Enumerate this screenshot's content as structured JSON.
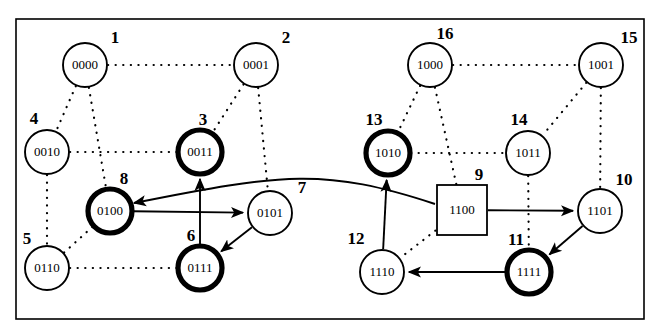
{
  "figure": {
    "name": "hypercube-state-transition-diagram",
    "border": {
      "x": 16,
      "y": 19,
      "width": 628,
      "height": 300,
      "color": "#000000"
    },
    "colors": {
      "ink": "#000000",
      "paper": "#ffffff",
      "highlight_ring": "#000000"
    }
  },
  "nodes": [
    {
      "id": "n1",
      "number": "1",
      "label": "0000",
      "shape": "circle",
      "emphasis": "normal",
      "cx": 85,
      "cy": 65,
      "r": 22,
      "num_dx": 30,
      "num_dy": -22
    },
    {
      "id": "n2",
      "number": "2",
      "label": "0001",
      "shape": "circle",
      "emphasis": "normal",
      "cx": 256,
      "cy": 65,
      "r": 22,
      "num_dx": 30,
      "num_dy": -22
    },
    {
      "id": "n3",
      "number": "3",
      "label": "0011",
      "shape": "circle",
      "emphasis": "bold",
      "cx": 200,
      "cy": 152,
      "r": 22,
      "num_dx": 3,
      "num_dy": -27
    },
    {
      "id": "n4",
      "number": "4",
      "label": "0010",
      "shape": "circle",
      "emphasis": "normal",
      "cx": 47,
      "cy": 152,
      "r": 22,
      "num_dx": -13,
      "num_dy": -28
    },
    {
      "id": "n5",
      "number": "5",
      "label": "0110",
      "shape": "circle",
      "emphasis": "normal",
      "cx": 47,
      "cy": 268,
      "r": 22,
      "num_dx": -20,
      "num_dy": -24
    },
    {
      "id": "n6",
      "number": "6",
      "label": "0111",
      "shape": "circle",
      "emphasis": "bold",
      "cx": 200,
      "cy": 268,
      "r": 22,
      "num_dx": -9,
      "num_dy": -27
    },
    {
      "id": "n7",
      "number": "7",
      "label": "0101",
      "shape": "circle",
      "emphasis": "normal",
      "cx": 270,
      "cy": 213,
      "r": 22,
      "num_dx": 32,
      "num_dy": -20
    },
    {
      "id": "n8",
      "number": "8",
      "label": "0100",
      "shape": "circle",
      "emphasis": "bold",
      "cx": 110,
      "cy": 211,
      "r": 22,
      "num_dx": 14,
      "num_dy": -27
    },
    {
      "id": "n9",
      "number": "9",
      "label": "1100",
      "shape": "square",
      "emphasis": "normal",
      "cx": 462,
      "cy": 210,
      "r": 25,
      "num_dx": 17,
      "num_dy": -30
    },
    {
      "id": "n10",
      "number": "10",
      "label": "1101",
      "shape": "circle",
      "emphasis": "normal",
      "cx": 600,
      "cy": 211,
      "r": 22,
      "num_dx": 24,
      "num_dy": -26
    },
    {
      "id": "n11",
      "number": "11",
      "label": "1111",
      "shape": "circle",
      "emphasis": "bold",
      "cx": 529,
      "cy": 272,
      "r": 22,
      "num_dx": -13,
      "num_dy": -27
    },
    {
      "id": "n12",
      "number": "12",
      "label": "1110",
      "shape": "circle",
      "emphasis": "normal",
      "cx": 382,
      "cy": 272,
      "r": 22,
      "num_dx": -26,
      "num_dy": -28
    },
    {
      "id": "n13",
      "number": "13",
      "label": "1010",
      "shape": "circle",
      "emphasis": "bold",
      "cx": 388,
      "cy": 153,
      "r": 22,
      "num_dx": -14,
      "num_dy": -28
    },
    {
      "id": "n14",
      "number": "14",
      "label": "1011",
      "shape": "circle",
      "emphasis": "normal",
      "cx": 528,
      "cy": 153,
      "r": 22,
      "num_dx": -9,
      "num_dy": -28
    },
    {
      "id": "n15",
      "number": "15",
      "label": "1001",
      "shape": "circle",
      "emphasis": "normal",
      "cx": 601,
      "cy": 65,
      "r": 22,
      "num_dx": 28,
      "num_dy": -22
    },
    {
      "id": "n16",
      "number": "16",
      "label": "1000",
      "shape": "circle",
      "emphasis": "normal",
      "cx": 430,
      "cy": 65,
      "r": 22,
      "num_dx": 15,
      "num_dy": -26
    }
  ],
  "dotted_edges": [
    {
      "name": "edge-0000-0001",
      "from": "n1",
      "to": "n2"
    },
    {
      "name": "edge-0000-0010",
      "from": "n1",
      "to": "n4"
    },
    {
      "name": "edge-0000-0100",
      "from": "n1",
      "to": "n8"
    },
    {
      "name": "edge-0001-0011",
      "from": "n2",
      "to": "n3"
    },
    {
      "name": "edge-0001-0101",
      "from": "n2",
      "to": "n7"
    },
    {
      "name": "edge-0010-0011",
      "from": "n4",
      "to": "n3"
    },
    {
      "name": "edge-0010-0110",
      "from": "n4",
      "to": "n5"
    },
    {
      "name": "edge-0110-0111",
      "from": "n5",
      "to": "n6"
    },
    {
      "name": "edge-0110-0100",
      "from": "n5",
      "to": "n8"
    },
    {
      "name": "edge-1000-1001",
      "from": "n16",
      "to": "n15"
    },
    {
      "name": "edge-1000-1010",
      "from": "n16",
      "to": "n13"
    },
    {
      "name": "edge-1000-1100",
      "from": "n16",
      "to": "n9"
    },
    {
      "name": "edge-1001-1011",
      "from": "n15",
      "to": "n14"
    },
    {
      "name": "edge-1001-1101",
      "from": "n15",
      "to": "n10"
    },
    {
      "name": "edge-1010-1011",
      "from": "n13",
      "to": "n14"
    },
    {
      "name": "edge-1011-1111",
      "from": "n14",
      "to": "n11"
    },
    {
      "name": "edge-1100-1110",
      "from": "n9",
      "to": "n12"
    }
  ],
  "arrows": [
    {
      "name": "arrow-0100-to-0101",
      "from": "n8",
      "to": "n7",
      "style": "straight"
    },
    {
      "name": "arrow-0101-to-0111",
      "from": "n7",
      "to": "n6",
      "style": "straight"
    },
    {
      "name": "arrow-0111-to-0011",
      "from": "n6",
      "to": "n3",
      "style": "straight"
    },
    {
      "name": "arrow-1100-to-1101",
      "from": "n9",
      "to": "n10",
      "style": "straight"
    },
    {
      "name": "arrow-1101-to-1111",
      "from": "n10",
      "to": "n11",
      "style": "straight"
    },
    {
      "name": "arrow-1111-to-1110",
      "from": "n11",
      "to": "n12",
      "style": "straight"
    },
    {
      "name": "arrow-1110-to-1010",
      "from": "n12",
      "to": "n13",
      "style": "straight"
    },
    {
      "name": "arrow-1100-to-0100",
      "from": "n9",
      "to": "n8",
      "style": "curved"
    }
  ]
}
